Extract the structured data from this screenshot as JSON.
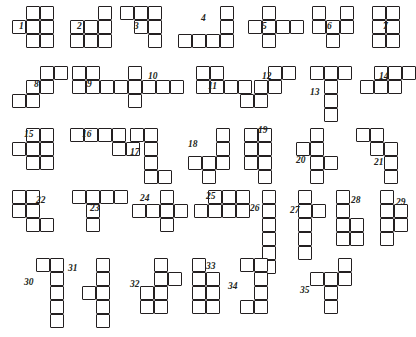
{
  "figure": {
    "kind": "shape-catalog",
    "cell_size": 14,
    "stroke_color": "#231f20",
    "fill_color": "#ffffff",
    "background": "#ffffff",
    "count": 35
  },
  "shapes": [
    {
      "id": 1,
      "label": "1",
      "x": 12,
      "y": 6,
      "cells": [
        [
          1,
          0
        ],
        [
          2,
          0
        ],
        [
          1,
          1
        ],
        [
          2,
          1
        ],
        [
          0,
          1
        ],
        [
          1,
          2
        ],
        [
          2,
          2
        ]
      ],
      "label_pos": [
        19,
        22
      ]
    },
    {
      "id": 2,
      "label": "2",
      "x": 70,
      "y": 6,
      "cells": [
        [
          2,
          0
        ],
        [
          0,
          1
        ],
        [
          1,
          1
        ],
        [
          2,
          1
        ],
        [
          0,
          2
        ],
        [
          1,
          2
        ],
        [
          2,
          2
        ]
      ],
      "label_pos": [
        77,
        22
      ]
    },
    {
      "id": 3,
      "label": "3",
      "x": 120,
      "y": 6,
      "cells": [
        [
          0,
          0
        ],
        [
          1,
          0
        ],
        [
          2,
          0
        ],
        [
          1,
          1
        ],
        [
          2,
          1
        ],
        [
          2,
          2
        ]
      ],
      "label_pos": [
        134,
        22
      ]
    },
    {
      "id": 4,
      "label": "4",
      "x": 178,
      "y": 6,
      "cells": [
        [
          3,
          0
        ],
        [
          3,
          1
        ],
        [
          0,
          2
        ],
        [
          1,
          2
        ],
        [
          2,
          2
        ],
        [
          3,
          2
        ]
      ],
      "label_pos": [
        201,
        14
      ]
    },
    {
      "id": 5,
      "label": "5",
      "x": 248,
      "y": 6,
      "cells": [
        [
          1,
          0
        ],
        [
          0,
          1
        ],
        [
          1,
          1
        ],
        [
          2,
          1
        ],
        [
          3,
          1
        ],
        [
          1,
          2
        ]
      ],
      "label_pos": [
        262,
        22
      ]
    },
    {
      "id": 6,
      "label": "6",
      "x": 312,
      "y": 6,
      "cells": [
        [
          0,
          0
        ],
        [
          2,
          0
        ],
        [
          0,
          1
        ],
        [
          1,
          1
        ],
        [
          2,
          1
        ],
        [
          1,
          2
        ]
      ],
      "label_pos": [
        327,
        22
      ]
    },
    {
      "id": 7,
      "label": "7",
      "x": 372,
      "y": 6,
      "cells": [
        [
          0,
          0
        ],
        [
          1,
          0
        ],
        [
          0,
          1
        ],
        [
          1,
          1
        ],
        [
          0,
          2
        ],
        [
          1,
          2
        ]
      ],
      "label_pos": [
        383,
        22
      ]
    },
    {
      "id": 8,
      "label": "8",
      "x": 12,
      "y": 66,
      "cells": [
        [
          2,
          0
        ],
        [
          3,
          0
        ],
        [
          1,
          1
        ],
        [
          2,
          1
        ],
        [
          0,
          2
        ],
        [
          1,
          2
        ]
      ],
      "label_pos": [
        34,
        80
      ]
    },
    {
      "id": 9,
      "label": "9",
      "x": 72,
      "y": 66,
      "cells": [
        [
          0,
          0
        ],
        [
          1,
          0
        ],
        [
          0,
          1
        ],
        [
          1,
          1
        ],
        [
          2,
          1
        ],
        [
          3,
          1
        ]
      ],
      "label_pos": [
        87,
        80
      ]
    },
    {
      "id": 10,
      "label": "10",
      "x": 128,
      "y": 66,
      "cells": [
        [
          0,
          0
        ],
        [
          0,
          1
        ],
        [
          1,
          1
        ],
        [
          2,
          1
        ],
        [
          3,
          1
        ],
        [
          0,
          2
        ]
      ],
      "label_pos": [
        148,
        72
      ]
    },
    {
      "id": 11,
      "label": "11",
      "x": 196,
      "y": 66,
      "cells": [
        [
          0,
          0
        ],
        [
          1,
          0
        ],
        [
          0,
          1
        ],
        [
          1,
          1
        ],
        [
          2,
          1
        ],
        [
          3,
          1
        ]
      ],
      "label_pos": [
        208,
        82
      ]
    },
    {
      "id": 12,
      "label": "12",
      "x": 240,
      "y": 66,
      "cells": [
        [
          2,
          0
        ],
        [
          3,
          0
        ],
        [
          1,
          1
        ],
        [
          2,
          1
        ],
        [
          0,
          2
        ],
        [
          1,
          2
        ]
      ],
      "label_pos": [
        262,
        72
      ]
    },
    {
      "id": 13,
      "label": "13",
      "x": 310,
      "y": 66,
      "cells": [
        [
          0,
          0
        ],
        [
          1,
          0
        ],
        [
          2,
          0
        ],
        [
          1,
          1
        ],
        [
          1,
          2
        ],
        [
          1,
          3
        ]
      ],
      "label_pos": [
        310,
        88
      ]
    },
    {
      "id": 14,
      "label": "14",
      "x": 360,
      "y": 66,
      "cells": [
        [
          1,
          0
        ],
        [
          2,
          0
        ],
        [
          3,
          0
        ],
        [
          0,
          1
        ],
        [
          1,
          1
        ],
        [
          2,
          1
        ]
      ],
      "label_pos": [
        379,
        72
      ]
    },
    {
      "id": 15,
      "label": "15",
      "x": 12,
      "y": 128,
      "cells": [
        [
          1,
          0
        ],
        [
          2,
          0
        ],
        [
          0,
          1
        ],
        [
          1,
          1
        ],
        [
          2,
          1
        ],
        [
          1,
          2
        ],
        [
          2,
          2
        ]
      ],
      "label_pos": [
        24,
        130
      ]
    },
    {
      "id": 16,
      "label": "16",
      "x": 70,
      "y": 128,
      "cells": [
        [
          0,
          0
        ],
        [
          1,
          0
        ],
        [
          2,
          0
        ],
        [
          3,
          0
        ],
        [
          3,
          1
        ],
        [
          4,
          1
        ]
      ],
      "label_pos": [
        82,
        130
      ]
    },
    {
      "id": 17,
      "label": "17",
      "x": 130,
      "y": 128,
      "cells": [
        [
          0,
          0
        ],
        [
          1,
          0
        ],
        [
          1,
          1
        ],
        [
          1,
          2
        ],
        [
          1,
          3
        ],
        [
          2,
          3
        ]
      ],
      "label_pos": [
        130,
        148
      ]
    },
    {
      "id": 18,
      "label": "18",
      "x": 188,
      "y": 128,
      "cells": [
        [
          2,
          0
        ],
        [
          2,
          1
        ],
        [
          0,
          2
        ],
        [
          1,
          2
        ],
        [
          2,
          2
        ],
        [
          1,
          3
        ]
      ],
      "label_pos": [
        188,
        140
      ]
    },
    {
      "id": 19,
      "label": "19",
      "x": 244,
      "y": 128,
      "cells": [
        [
          0,
          0
        ],
        [
          1,
          0
        ],
        [
          0,
          1
        ],
        [
          1,
          1
        ],
        [
          0,
          2
        ],
        [
          1,
          2
        ],
        [
          1,
          3
        ]
      ],
      "label_pos": [
        258,
        126
      ]
    },
    {
      "id": 20,
      "label": "20",
      "x": 296,
      "y": 128,
      "cells": [
        [
          1,
          0
        ],
        [
          0,
          1
        ],
        [
          1,
          1
        ],
        [
          1,
          2
        ],
        [
          2,
          2
        ],
        [
          1,
          3
        ]
      ],
      "label_pos": [
        296,
        156
      ]
    },
    {
      "id": 21,
      "label": "21",
      "x": 356,
      "y": 128,
      "cells": [
        [
          0,
          0
        ],
        [
          1,
          0
        ],
        [
          1,
          1
        ],
        [
          2,
          1
        ],
        [
          2,
          2
        ],
        [
          2,
          3
        ]
      ],
      "label_pos": [
        374,
        158
      ]
    },
    {
      "id": 22,
      "label": "22",
      "x": 12,
      "y": 190,
      "cells": [
        [
          0,
          0
        ],
        [
          1,
          0
        ],
        [
          0,
          1
        ],
        [
          1,
          1
        ],
        [
          1,
          2
        ],
        [
          2,
          2
        ]
      ],
      "label_pos": [
        36,
        196
      ]
    },
    {
      "id": 23,
      "label": "23",
      "x": 72,
      "y": 190,
      "cells": [
        [
          0,
          0
        ],
        [
          1,
          0
        ],
        [
          2,
          0
        ],
        [
          3,
          0
        ],
        [
          1,
          1
        ],
        [
          1,
          2
        ]
      ],
      "label_pos": [
        90,
        204
      ]
    },
    {
      "id": 24,
      "label": "24",
      "x": 132,
      "y": 190,
      "cells": [
        [
          2,
          0
        ],
        [
          0,
          1
        ],
        [
          1,
          1
        ],
        [
          2,
          1
        ],
        [
          3,
          1
        ],
        [
          2,
          2
        ]
      ],
      "label_pos": [
        140,
        194
      ]
    },
    {
      "id": 25,
      "label": "25",
      "x": 194,
      "y": 190,
      "cells": [
        [
          1,
          0
        ],
        [
          2,
          0
        ],
        [
          3,
          0
        ],
        [
          0,
          1
        ],
        [
          1,
          1
        ],
        [
          2,
          1
        ],
        [
          3,
          1
        ]
      ],
      "label_pos": [
        206,
        192
      ]
    },
    {
      "id": 26,
      "label": "26",
      "x": 262,
      "y": 190,
      "cells": [
        [
          0,
          0
        ],
        [
          0,
          1
        ],
        [
          0,
          2
        ],
        [
          0,
          3
        ],
        [
          0,
          4
        ],
        [
          0,
          5
        ]
      ],
      "label_pos": [
        250,
        204
      ]
    },
    {
      "id": 27,
      "label": "27",
      "x": 298,
      "y": 190,
      "cells": [
        [
          0,
          0
        ],
        [
          0,
          1
        ],
        [
          1,
          1
        ],
        [
          0,
          2
        ],
        [
          0,
          3
        ],
        [
          0,
          4
        ]
      ],
      "label_pos": [
        290,
        206
      ]
    },
    {
      "id": 28,
      "label": "28",
      "x": 336,
      "y": 190,
      "cells": [
        [
          0,
          0
        ],
        [
          0,
          1
        ],
        [
          0,
          2
        ],
        [
          1,
          2
        ],
        [
          1,
          3
        ],
        [
          0,
          3
        ]
      ],
      "label_pos": [
        351,
        196
      ]
    },
    {
      "id": 29,
      "label": "29",
      "x": 380,
      "y": 190,
      "cells": [
        [
          0,
          0
        ],
        [
          0,
          1
        ],
        [
          1,
          1
        ],
        [
          0,
          2
        ],
        [
          1,
          2
        ],
        [
          0,
          3
        ]
      ],
      "label_pos": [
        396,
        198
      ]
    },
    {
      "id": 30,
      "label": "30",
      "x": 36,
      "y": 258,
      "cells": [
        [
          0,
          0
        ],
        [
          1,
          0
        ],
        [
          1,
          1
        ],
        [
          1,
          2
        ],
        [
          1,
          3
        ],
        [
          1,
          4
        ]
      ],
      "label_pos": [
        24,
        278
      ]
    },
    {
      "id": 31,
      "label": "31",
      "x": 82,
      "y": 258,
      "cells": [
        [
          1,
          0
        ],
        [
          1,
          1
        ],
        [
          0,
          2
        ],
        [
          1,
          2
        ],
        [
          1,
          3
        ],
        [
          1,
          4
        ]
      ],
      "label_pos": [
        68,
        264
      ]
    },
    {
      "id": 32,
      "label": "32",
      "x": 140,
      "y": 258,
      "cells": [
        [
          1,
          0
        ],
        [
          1,
          1
        ],
        [
          2,
          1
        ],
        [
          0,
          2
        ],
        [
          1,
          2
        ],
        [
          0,
          3
        ],
        [
          1,
          3
        ]
      ],
      "label_pos": [
        130,
        280
      ]
    },
    {
      "id": 33,
      "label": "33",
      "x": 192,
      "y": 258,
      "cells": [
        [
          0,
          0
        ],
        [
          0,
          1
        ],
        [
          1,
          1
        ],
        [
          0,
          2
        ],
        [
          1,
          2
        ],
        [
          0,
          3
        ],
        [
          1,
          3
        ]
      ],
      "label_pos": [
        206,
        262
      ]
    },
    {
      "id": 34,
      "label": "34",
      "x": 240,
      "y": 258,
      "cells": [
        [
          0,
          0
        ],
        [
          1,
          0
        ],
        [
          1,
          1
        ],
        [
          1,
          2
        ],
        [
          0,
          3
        ],
        [
          1,
          3
        ]
      ],
      "label_pos": [
        228,
        282
      ]
    },
    {
      "id": 35,
      "label": "35",
      "x": 310,
      "y": 258,
      "cells": [
        [
          2,
          0
        ],
        [
          0,
          1
        ],
        [
          1,
          1
        ],
        [
          2,
          1
        ],
        [
          1,
          2
        ],
        [
          1,
          3
        ]
      ],
      "label_pos": [
        300,
        286
      ]
    }
  ]
}
